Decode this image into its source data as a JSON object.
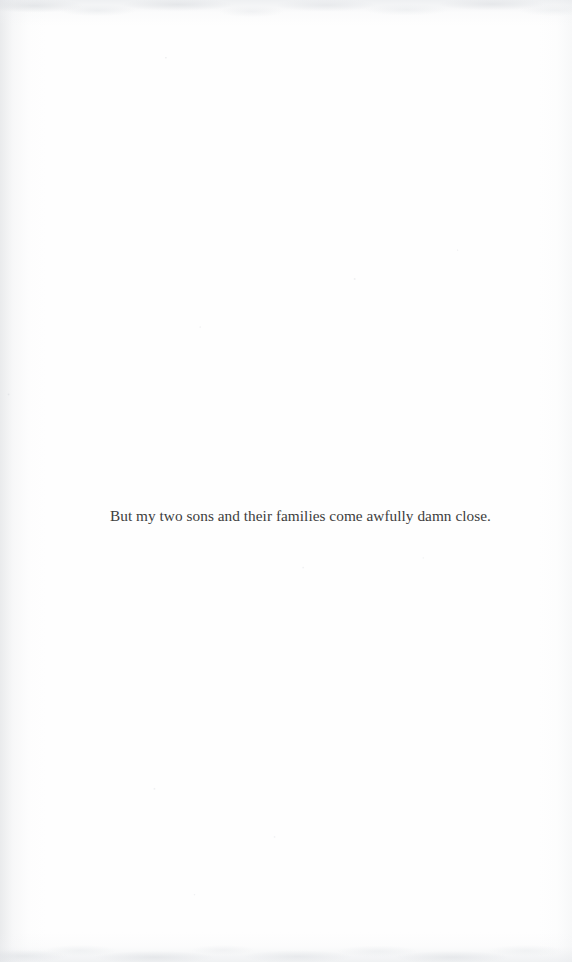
{
  "document": {
    "type": "scanned-book-page",
    "page_background_color": "#fefefe",
    "text_color": "#3d3d3d",
    "body": {
      "lines": [
        "But my two sons and their families come awfully damn close."
      ]
    },
    "header": {
      "running_head": "",
      "page_number": ""
    },
    "footer": {
      "page_number": ""
    }
  }
}
